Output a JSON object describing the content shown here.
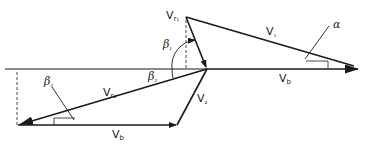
{
  "diagram": {
    "colors": {
      "line": "#1a1a1a",
      "background": "#ffffff"
    },
    "labels": {
      "vr1": {
        "base": "V",
        "sub": "r₁"
      },
      "v1": {
        "base": "V",
        "sub": "₁"
      },
      "alpha": "α",
      "beta1": {
        "base": "β",
        "sub": "₁"
      },
      "beta2_upper": {
        "base": "β",
        "sub": "₂"
      },
      "beta2_lower": {
        "base": "β",
        "sub": "₂"
      },
      "vr2": {
        "base": "V",
        "sub": "r₂"
      },
      "v2": {
        "base": "V",
        "sub": "₂"
      },
      "vb_upper": {
        "base": "V",
        "sub": "b"
      },
      "vb_lower": {
        "base": "V",
        "sub": "b"
      }
    },
    "vectors": [
      {
        "name": "V1",
        "from": [
          186,
          17
        ],
        "to": [
          355,
          66
        ]
      },
      {
        "name": "Vr1",
        "from": [
          186,
          17
        ],
        "to": [
          207,
          69
        ]
      },
      {
        "name": "Vb-upper",
        "from": [
          207,
          69
        ],
        "to": [
          358,
          69
        ]
      },
      {
        "name": "Vr2",
        "from": [
          207,
          69
        ],
        "to": [
          18,
          125
        ]
      },
      {
        "name": "V2",
        "from": [
          207,
          69
        ],
        "to": [
          177,
          125
        ]
      },
      {
        "name": "Vb-lower",
        "from": [
          18,
          125
        ],
        "to": [
          177,
          125
        ]
      }
    ]
  }
}
